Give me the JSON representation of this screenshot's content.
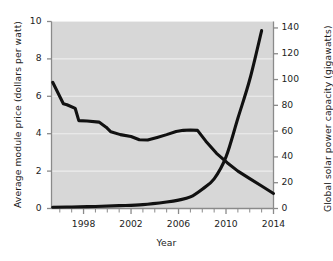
{
  "chart_data": {
    "type": "line",
    "title": "",
    "xlabel": "Year",
    "xlim": [
      1995.3,
      2014
    ],
    "grid": true,
    "legend_position": "inline-annotations",
    "x_ticks_major": [
      1998,
      2002,
      2006,
      2010,
      2014
    ],
    "x_ticks_minor": [
      1996,
      1997,
      1999,
      2000,
      2001,
      2003,
      2004,
      2005,
      2007,
      2008,
      2009,
      2011,
      2012,
      2013
    ],
    "axes": [
      {
        "id": "left",
        "label": "Average module price (dollars per watt)",
        "ticks": [
          0,
          2,
          4,
          6,
          8,
          10
        ],
        "lim": [
          0,
          10
        ]
      },
      {
        "id": "right",
        "label": "Global solar power capacity (gigawatts)",
        "ticks": [
          0,
          20,
          40,
          60,
          80,
          100,
          120,
          140
        ],
        "lim": [
          0,
          145
        ]
      }
    ],
    "series": [
      {
        "name": "Price",
        "axis": "left",
        "unit": "dollars per watt",
        "annotation": "Price",
        "x": [
          1995.4,
          1996.3,
          1996.6,
          1997.3,
          1997.6,
          1998.3,
          1999.3,
          1999.9,
          2000.3,
          2001.1,
          2002.0,
          2002.7,
          2003.4,
          2004.2,
          2005.0,
          2005.8,
          2006.4,
          2007.0,
          2007.6,
          2008.3,
          2009.2,
          2010.1,
          2011.0,
          2012.0,
          2013.0,
          2014.0
        ],
        "y": [
          6.75,
          5.6,
          5.55,
          5.35,
          4.7,
          4.68,
          4.62,
          4.35,
          4.1,
          3.95,
          3.85,
          3.68,
          3.66,
          3.8,
          3.95,
          4.12,
          4.18,
          4.2,
          4.18,
          3.6,
          2.95,
          2.45,
          2.0,
          1.6,
          1.2,
          0.8
        ]
      },
      {
        "name": "Production",
        "axis": "right",
        "unit": "gigawatts",
        "annotation": "Production",
        "x": [
          1995.4,
          1997,
          1999,
          2001,
          2003,
          2005,
          2006,
          2007,
          2008,
          2009,
          2010,
          2011,
          2012,
          2013
        ],
        "y": [
          1.0,
          1.2,
          1.6,
          2.2,
          3.0,
          5.0,
          6.5,
          9.0,
          15.0,
          23.0,
          40.0,
          70.0,
          100.0,
          138.0
        ]
      }
    ]
  }
}
